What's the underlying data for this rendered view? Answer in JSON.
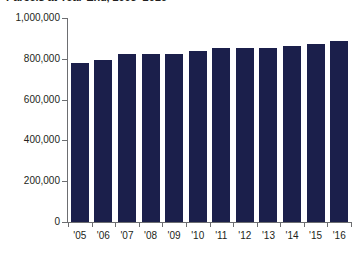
{
  "chart_data": {
    "type": "bar",
    "title": "Parcels at Year-End, 2005–2016",
    "xlabel": "",
    "ylabel": "",
    "categories": [
      "'05",
      "'06",
      "'07",
      "'08",
      "'09",
      "'10",
      "'11",
      "'12",
      "'13",
      "'14",
      "'15",
      "'16"
    ],
    "values": [
      780000,
      795000,
      825000,
      825000,
      825000,
      840000,
      855000,
      855000,
      855000,
      865000,
      875000,
      885000
    ],
    "ylim": [
      0,
      1000000
    ],
    "ytick_labels": [
      "1,000,000",
      "800,000",
      "600,000",
      "400,000",
      "200,000",
      "0"
    ],
    "ytick_values": [
      1000000,
      800000,
      600000,
      400000,
      200000,
      0
    ],
    "grid": false,
    "legend": null,
    "bar_color": "#1b1f4b",
    "axis_color": "#6d6e71",
    "text_color": "#231f20"
  }
}
